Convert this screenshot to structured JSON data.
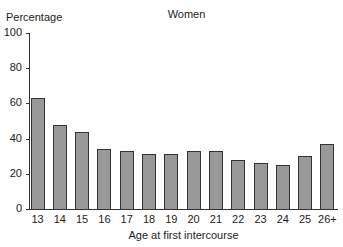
{
  "chart_data": {
    "type": "bar",
    "title": "Women",
    "xlabel": "Age at first intercourse",
    "ylabel": "Percentage",
    "ylim": [
      0,
      100
    ],
    "yticks": [
      0,
      20,
      40,
      60,
      80,
      100
    ],
    "grid": false,
    "legend": null,
    "categories": [
      "13",
      "14",
      "15",
      "16",
      "17",
      "18",
      "19",
      "20",
      "21",
      "22",
      "23",
      "24",
      "25",
      "26+"
    ],
    "values": [
      63,
      48,
      44,
      34,
      33,
      31,
      31,
      33,
      33,
      28,
      26,
      25,
      30,
      37
    ],
    "bar_color": "#999999",
    "edge_color": "#333333"
  }
}
